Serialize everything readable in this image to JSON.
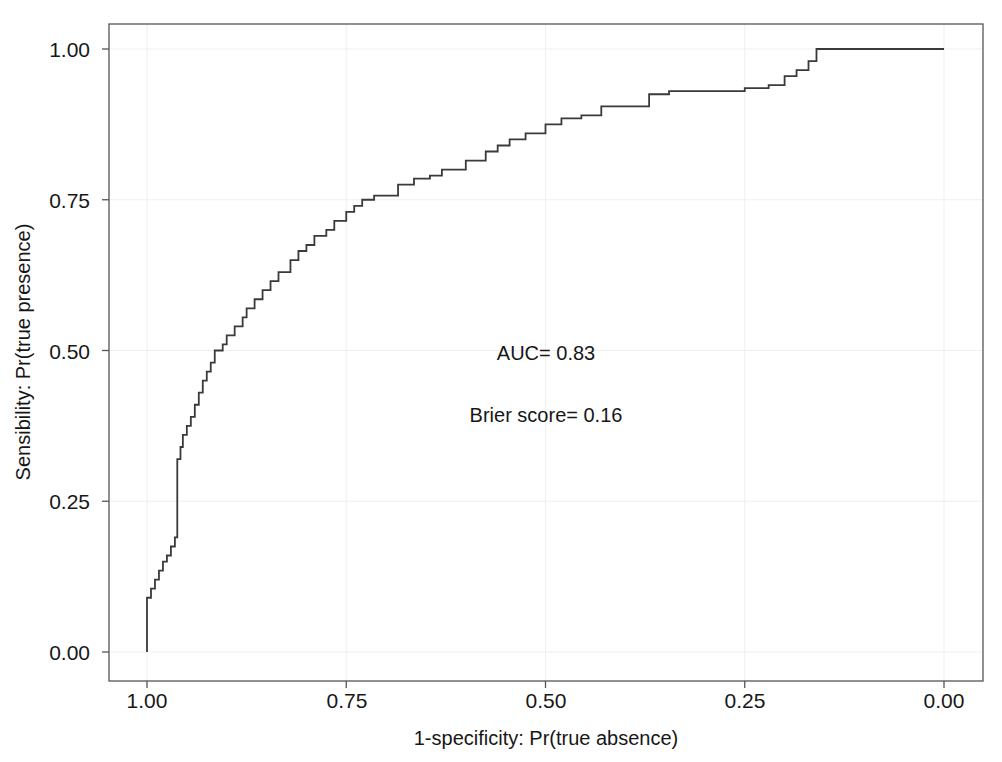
{
  "chart_data": {
    "type": "line",
    "subtype": "roc-step-curve",
    "title": "",
    "xlabel": "1-specificity: Pr(true absence)",
    "ylabel": "Sensibility: Pr(true presence)",
    "xlim": [
      1.0,
      0.0
    ],
    "ylim": [
      0.0,
      1.0
    ],
    "x_axis_reversed": true,
    "grid": true,
    "legend": "none",
    "xticks": [
      "1.00",
      "0.75",
      "0.50",
      "0.25",
      "0.00"
    ],
    "xtick_values": [
      1.0,
      0.75,
      0.5,
      0.25,
      0.0
    ],
    "yticks": [
      "0.00",
      "0.25",
      "0.50",
      "0.75",
      "1.00"
    ],
    "ytick_values": [
      0.0,
      0.25,
      0.5,
      0.75,
      1.0
    ],
    "series": [
      {
        "name": "ROC curve",
        "color": "#3a3a3a",
        "x": [
          1.0,
          1.0,
          0.995,
          0.99,
          0.985,
          0.98,
          0.975,
          0.97,
          0.965,
          0.962,
          0.958,
          0.955,
          0.95,
          0.945,
          0.94,
          0.935,
          0.93,
          0.925,
          0.92,
          0.915,
          0.905,
          0.9,
          0.89,
          0.88,
          0.875,
          0.865,
          0.855,
          0.845,
          0.835,
          0.82,
          0.81,
          0.8,
          0.79,
          0.775,
          0.765,
          0.75,
          0.74,
          0.73,
          0.715,
          0.7,
          0.685,
          0.665,
          0.645,
          0.63,
          0.6,
          0.575,
          0.56,
          0.545,
          0.525,
          0.5,
          0.48,
          0.455,
          0.43,
          0.4,
          0.37,
          0.345,
          0.3,
          0.25,
          0.22,
          0.2,
          0.185,
          0.17,
          0.16,
          0.0
        ],
        "y": [
          0.0,
          0.09,
          0.105,
          0.12,
          0.135,
          0.15,
          0.16,
          0.175,
          0.19,
          0.32,
          0.34,
          0.36,
          0.375,
          0.39,
          0.41,
          0.43,
          0.45,
          0.465,
          0.48,
          0.5,
          0.51,
          0.525,
          0.54,
          0.555,
          0.57,
          0.585,
          0.6,
          0.615,
          0.63,
          0.65,
          0.665,
          0.675,
          0.69,
          0.7,
          0.715,
          0.73,
          0.74,
          0.75,
          0.757,
          0.757,
          0.775,
          0.785,
          0.79,
          0.8,
          0.815,
          0.83,
          0.84,
          0.85,
          0.86,
          0.875,
          0.885,
          0.89,
          0.905,
          0.905,
          0.925,
          0.93,
          0.93,
          0.935,
          0.94,
          0.955,
          0.965,
          0.98,
          1.0,
          1.0
        ]
      }
    ],
    "annotations": [
      {
        "name": "auc",
        "text": "AUC= 0.83",
        "x": 0.5,
        "y": 0.5
      },
      {
        "name": "brier",
        "text": "Brier score= 0.16",
        "x": 0.5,
        "y": 0.4
      }
    ]
  },
  "figure": {
    "background_color": "#ffffff",
    "frame_color": "#555555",
    "grid_color": "#efefef",
    "curve_color": "#3a3a3a",
    "text_color": "#171717"
  },
  "labels": {
    "xtick_0": "1.00",
    "xtick_1": "0.75",
    "xtick_2": "0.50",
    "xtick_3": "0.25",
    "xtick_4": "0.00",
    "ytick_0": "0.00",
    "ytick_1": "0.25",
    "ytick_2": "0.50",
    "ytick_3": "0.75",
    "ytick_4": "1.00",
    "x_axis_title": "1-specificity: Pr(true absence)",
    "y_axis_title": "Sensibility: Pr(true presence)",
    "annotation_auc": "AUC= 0.83",
    "annotation_brier": "Brier score= 0.16"
  }
}
